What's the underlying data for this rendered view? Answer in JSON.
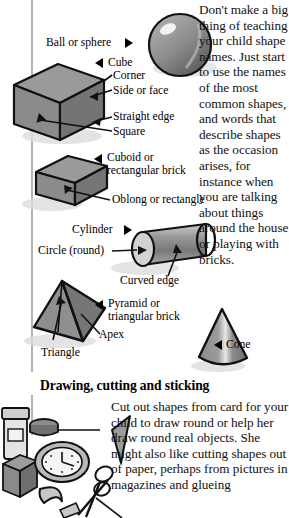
{
  "page": {
    "width": 289,
    "height": 518,
    "background": "#ffffff",
    "rule_color": "#b3b3b3"
  },
  "columns": {
    "top_paragraph": "Don't make a big thing of teaching your child shape names. Just start to use the names of the most common shapes, and words that describe shapes as the occasion arises, for instance when you are talking about things around the house or playing with bricks.",
    "bottom_paragraph": "Cut out shapes from card for your child to draw round or help her draw round real objects. She might also like cutting shapes out of paper, perhaps from pictures in magazines and glueing"
  },
  "heading": {
    "drawing_cutting_sticking": "Drawing, cutting and sticking"
  },
  "labels": {
    "ball_or_sphere": "Ball or sphere",
    "cube": "Cube",
    "corner": "Corner",
    "side_or_face": "Side or face",
    "straight_edge": "Straight edge",
    "square": "Square",
    "cuboid_line1": "Cuboid or",
    "cuboid_line2": "rectangular brick",
    "oblong_or_rectangle": "Oblong or rectangle",
    "cylinder": "Cylinder",
    "circle_round": "Circle (round)",
    "curved_edge": "Curved edge",
    "pyramid_line1": "Pyramid or",
    "pyramid_line2": "triangular brick",
    "apex": "Apex",
    "triangle": "Triangle",
    "cone": "Cone"
  },
  "shapes": [
    {
      "name": "sphere",
      "label": "Ball or sphere",
      "marker": "triangle-right"
    },
    {
      "name": "cube",
      "label": "Cube",
      "marker": "triangle-left"
    },
    {
      "name": "cuboid",
      "label": "Cuboid or rectangular brick",
      "marker": "triangle-left"
    },
    {
      "name": "cylinder",
      "label": "Cylinder",
      "marker": "triangle-right"
    },
    {
      "name": "pyramid",
      "label": "Pyramid or triangular brick",
      "marker": "triangle-left"
    },
    {
      "name": "cone",
      "label": "Cone",
      "marker": "triangle-left"
    }
  ],
  "colors": {
    "ink": "#151515",
    "shape_fill": "#8c8c8c",
    "shape_fill_dark": "#6e6e6e",
    "shape_fill_light": "#b5b5b5",
    "shadow": "#d8d8d8",
    "outline": "#111111"
  }
}
